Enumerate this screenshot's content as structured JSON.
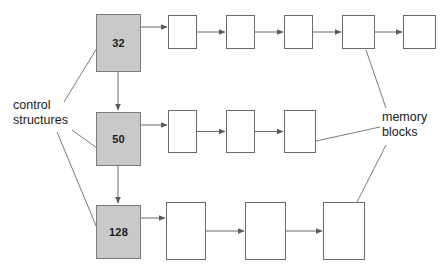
{
  "diagram": {
    "background_color": "#ffffff",
    "control_fill_color": "#c9c9c9",
    "block_fill_color": "#ffffff",
    "stroke_color": "#6b6b6b",
    "text_color": "#1a1a1a"
  },
  "annotations": {
    "control_structures": {
      "line1": "control",
      "line2": "structures"
    },
    "memory_blocks": {
      "line1": "memory",
      "line2": "blocks"
    }
  },
  "control_structures": [
    {
      "id": "control-32",
      "label": "32",
      "x": 96,
      "y": 14,
      "w": 45,
      "h": 58
    },
    {
      "id": "control-50",
      "label": "50",
      "x": 96,
      "y": 112,
      "w": 45,
      "h": 54
    },
    {
      "id": "control-128",
      "label": "128",
      "x": 96,
      "y": 205,
      "w": 45,
      "h": 54
    }
  ],
  "rows": [
    {
      "id": "row-32",
      "control": "32",
      "block_count": 5,
      "blocks": [
        {
          "x": 168,
          "y": 15,
          "w": 29,
          "h": 34
        },
        {
          "x": 226,
          "y": 15,
          "w": 29,
          "h": 34
        },
        {
          "x": 284,
          "y": 15,
          "w": 29,
          "h": 34
        },
        {
          "x": 342,
          "y": 15,
          "w": 33,
          "h": 34
        },
        {
          "x": 403,
          "y": 15,
          "w": 33,
          "h": 34
        }
      ]
    },
    {
      "id": "row-50",
      "control": "50",
      "block_count": 3,
      "blocks": [
        {
          "x": 168,
          "y": 110,
          "w": 29,
          "h": 43
        },
        {
          "x": 226,
          "y": 110,
          "w": 29,
          "h": 43
        },
        {
          "x": 284,
          "y": 110,
          "w": 32,
          "h": 43
        }
      ]
    },
    {
      "id": "row-128",
      "control": "128",
      "block_count": 3,
      "blocks": [
        {
          "x": 166,
          "y": 202,
          "w": 40,
          "h": 58
        },
        {
          "x": 245,
          "y": 202,
          "w": 41,
          "h": 58
        },
        {
          "x": 323,
          "y": 202,
          "w": 42,
          "h": 58
        }
      ]
    }
  ],
  "connectors": {
    "vertical_chain": [
      {
        "from": "control-32",
        "to": "control-50",
        "x": 118,
        "y1": 72,
        "y2": 110
      },
      {
        "from": "control-50",
        "to": "control-128",
        "x": 118,
        "y1": 166,
        "y2": 203
      }
    ],
    "leader_lines": [
      {
        "name": "control-to-32",
        "x1": 64,
        "y1": 102,
        "x2": 97,
        "y2": 48
      },
      {
        "name": "control-to-50",
        "x1": 72,
        "y1": 130,
        "x2": 97,
        "y2": 148
      },
      {
        "name": "control-to-128",
        "x1": 57,
        "y1": 132,
        "x2": 97,
        "y2": 228
      },
      {
        "name": "memory-to-top",
        "x1": 366,
        "y1": 50,
        "x2": 386,
        "y2": 108
      },
      {
        "name": "memory-to-mid",
        "x1": 316,
        "y1": 141,
        "x2": 380,
        "y2": 127
      },
      {
        "name": "memory-to-bot",
        "x1": 356,
        "y1": 204,
        "x2": 386,
        "y2": 145
      }
    ]
  }
}
